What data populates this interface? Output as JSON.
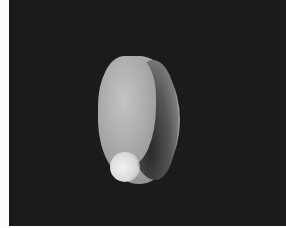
{
  "image": {
    "subject": "Sea snail shell photographed on black background, aperture view",
    "description": "An oval, glossy grey-white gastropod shell with a large curved aperture on the right side",
    "colors": {
      "background": "#1b1b1b",
      "border": "#fbfbfb",
      "shell_light": "#c9c9c9",
      "shell_shadow": "#5a5a5a",
      "aperture_dark": "#2a2a2a"
    }
  }
}
